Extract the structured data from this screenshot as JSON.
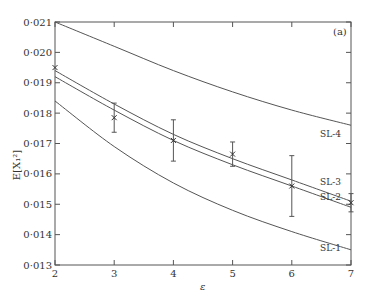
{
  "chart_data": {
    "type": "line",
    "title": "",
    "panel_label": "(a)",
    "xlabel": "ε",
    "ylabel": "E[X₁²]",
    "xlim": [
      2,
      7
    ],
    "ylim": [
      0.013,
      0.021
    ],
    "xticks": [
      2,
      3,
      4,
      5,
      6,
      7
    ],
    "xtick_labels": [
      "2",
      "3",
      "4",
      "5",
      "6",
      "7"
    ],
    "yticks": [
      0.013,
      0.014,
      0.015,
      0.016,
      0.017,
      0.018,
      0.019,
      0.02,
      0.021
    ],
    "ytick_labels": [
      "0·013",
      "0·014",
      "0·015",
      "0·016",
      "0·017",
      "0·018",
      "0·019",
      "0·020",
      "0·021"
    ],
    "grid": false,
    "legend": "inline labels at right",
    "x": [
      2,
      3,
      4,
      5,
      6,
      7
    ],
    "series": [
      {
        "name": "SL-4",
        "values": [
          0.021,
          0.0202,
          0.0194,
          0.0187,
          0.0181,
          0.0176
        ]
      },
      {
        "name": "SL-3",
        "values": [
          0.0194,
          0.0183,
          0.0173,
          0.0165,
          0.0158,
          0.0151
        ]
      },
      {
        "name": "SL-2",
        "values": [
          0.0192,
          0.0181,
          0.0171,
          0.0163,
          0.0156,
          0.0149
        ]
      },
      {
        "name": "SL-1",
        "values": [
          0.0184,
          0.0169,
          0.0157,
          0.0148,
          0.0141,
          0.0135
        ]
      }
    ],
    "points": {
      "name": "simulation",
      "marker": "x",
      "x": [
        2,
        3,
        4,
        5,
        6,
        7
      ],
      "y": [
        0.0195,
        0.01785,
        0.0171,
        0.01665,
        0.0156,
        0.01505
      ],
      "err": [
        0.0,
        0.00048,
        0.00068,
        0.0004,
        0.001,
        0.0003
      ]
    }
  }
}
